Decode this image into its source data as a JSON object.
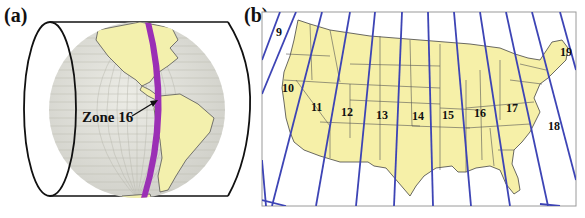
{
  "panels": {
    "a": {
      "label": "(a)",
      "callout": "Zone 16",
      "description": "Globe inside a transverse cylinder showing UTM Zone 16 strip over the Americas"
    },
    "b": {
      "label": "(b)",
      "zone_labels": [
        "9",
        "10",
        "11",
        "12",
        "13",
        "14",
        "15",
        "16",
        "17",
        "18",
        "19"
      ],
      "description": "Contiguous United States with UTM zone boundaries"
    }
  },
  "colors": {
    "land": "#f6f0a8",
    "globe_ocean": "#e4e4dc",
    "zone_strip": "#9b2fb5",
    "zone_lines": "#3d44b5",
    "outline": "#111111",
    "frame": "#9a9a9a"
  }
}
